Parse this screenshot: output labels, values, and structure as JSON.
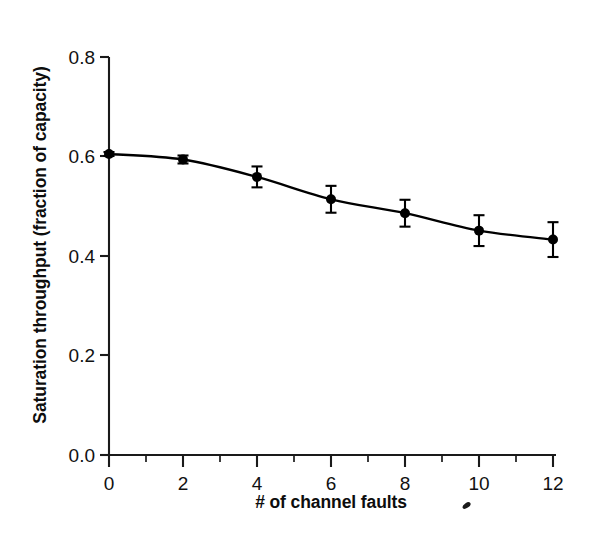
{
  "chart_data": {
    "type": "line",
    "title": "",
    "xlabel": "# of channel faults",
    "ylabel": "Saturation throughput (fraction of capacity)",
    "x": [
      0,
      2,
      4,
      6,
      8,
      10,
      12
    ],
    "values": [
      0.605,
      0.594,
      0.559,
      0.514,
      0.486,
      0.451,
      0.433
    ],
    "yerr": [
      0.004,
      0.008,
      0.021,
      0.027,
      0.027,
      0.031,
      0.035
    ],
    "series": [
      {
        "name": "Saturation throughput",
        "x": [
          0,
          2,
          4,
          6,
          8,
          10,
          12
        ],
        "values": [
          0.605,
          0.594,
          0.559,
          0.514,
          0.486,
          0.451,
          0.433
        ],
        "yerr": [
          0.004,
          0.008,
          0.021,
          0.027,
          0.027,
          0.031,
          0.035
        ],
        "marker": "filled-circle",
        "color": "#000000"
      }
    ],
    "xlim": [
      0,
      12
    ],
    "ylim": [
      0.0,
      0.8
    ],
    "xticks": [
      0,
      2,
      4,
      6,
      8,
      10,
      12
    ],
    "xtick_labels": [
      "0",
      "2",
      "4",
      "6",
      "8",
      "10",
      "12"
    ],
    "xminorticks": [
      1,
      3,
      5,
      7,
      9,
      11
    ],
    "yticks": [
      0.0,
      0.2,
      0.4,
      0.6,
      0.8
    ],
    "ytick_labels": [
      "0.0",
      "0.2",
      "0.4",
      "0.6",
      "0.8"
    ],
    "grid": false,
    "legend": "none",
    "annotations": []
  },
  "axes": {
    "x_tick_labels": [
      "0",
      "2",
      "4",
      "6",
      "8",
      "10",
      "12"
    ],
    "y_tick_labels": [
      "0.0",
      "0.2",
      "0.4",
      "0.6",
      "0.8"
    ],
    "x_title": "# of channel faults",
    "y_title": "Saturation throughput (fraction of capacity)"
  },
  "colors": {
    "line": "#000000",
    "marker": "#000000",
    "axis": "#1a1a1a",
    "background": "#ffffff"
  }
}
